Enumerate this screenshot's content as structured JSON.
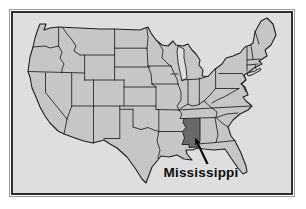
{
  "figure": {
    "type": "locator-map",
    "region": "United States (contiguous 48 states)",
    "highlighted_state": {
      "name": "Mississippi",
      "label": "Mississippi"
    },
    "colors": {
      "page_background": "#ffffff",
      "panel_background": "#dedede",
      "state_fill": "#c6c6c6",
      "highlight_fill": "#696969",
      "boundary_line": "#1f1f1f",
      "frame_border": "#2e2e2e",
      "frame_halo": "#9a9a9a",
      "label_text": "#0d0d0d"
    }
  }
}
